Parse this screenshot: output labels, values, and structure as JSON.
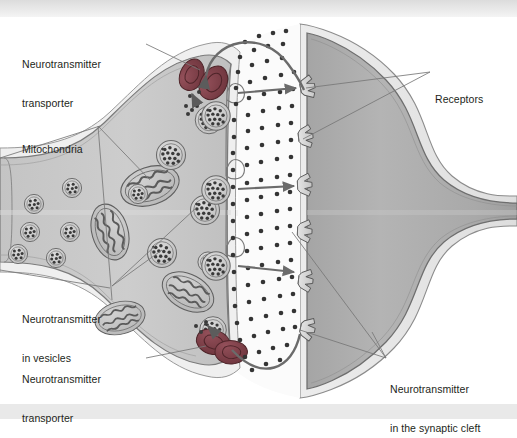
{
  "figure": {
    "background_color": "#ffffff",
    "band_color": "#e3e3e3",
    "label_color": "#231f20",
    "leader_color": "#6f6f6f"
  },
  "labels": [
    {
      "id": "neurotransmitter-transporter-top",
      "line1": "Neurotransmitter",
      "line2": "transporter",
      "x": 22,
      "y": 32,
      "anchor": "left"
    },
    {
      "id": "mitochondria",
      "line1": "Mitochondria",
      "line2": "",
      "x": 22,
      "y": 117,
      "anchor": "left"
    },
    {
      "id": "neurotransmitter-in-vesicles",
      "line1": "Neurotransmitter",
      "line2": "in vesicles",
      "x": 22,
      "y": 287,
      "anchor": "left"
    },
    {
      "id": "neurotransmitter-transporter-bottom",
      "line1": "Neurotransmitter",
      "line2": "transporter",
      "x": 22,
      "y": 347,
      "anchor": "left"
    },
    {
      "id": "receptors",
      "line1": "Receptors",
      "line2": "",
      "x": 435,
      "y": 67,
      "anchor": "left"
    },
    {
      "id": "neurotransmitter-in-the-synaptic-cleft",
      "line1": "Neurotransmitter",
      "line2": "in the synaptic cleft",
      "x": 390,
      "y": 357,
      "anchor": "left"
    }
  ],
  "structures": {
    "presynaptic_terminal": {
      "name": "presynaptic axon terminal",
      "cytoplasm_color": "#c9c9c9",
      "membrane_color": "#7a7a7a",
      "outer_layer_color": "#efefef"
    },
    "postsynaptic_cell": {
      "name": "postsynaptic dendritic spine",
      "cytoplasm_color": "#b0b0b0",
      "membrane_color": "#6e6e6e",
      "outer_layer_color": "#e8e8e8"
    },
    "synaptic_cleft": {
      "name": "synaptic cleft",
      "fill_color": "#fbfbfb"
    },
    "transporter": {
      "name": "neurotransmitter transporter protein",
      "fill_color": "#7a3b42",
      "shape": "kidney-bean",
      "count": 4
    },
    "mitochondrion": {
      "name": "mitochondrion",
      "fill_color": "#c2c2c2",
      "membrane_color": "#5e5e5e",
      "count": 5
    },
    "vesicle": {
      "name": "synaptic vesicle",
      "fill_color": "#cfcfcf",
      "membrane_color": "#6a6a6a",
      "granule_color": "#3a3a3a",
      "count": 12
    },
    "receptor": {
      "name": "postsynaptic receptor",
      "fill_color": "#d8d8d8",
      "outline_color": "#5a5a5a",
      "count": 6
    },
    "neurotransmitter_molecule": {
      "name": "neurotransmitter molecule",
      "color": "#3a3a3a",
      "count_in_cleft": 86
    },
    "release_arrow": {
      "name": "neurotransmitter release arrow",
      "color": "#6b6b6b",
      "count": 4
    },
    "reuptake_arrow": {
      "name": "neurotransmitter reuptake arrow",
      "color": "#6b6b6b",
      "count": 2
    }
  }
}
